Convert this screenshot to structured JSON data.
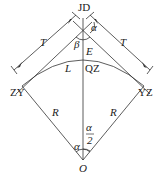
{
  "diagram": {
    "type": "circular-curve-elements",
    "stroke_color": "#333333",
    "background": "#ffffff",
    "labels": {
      "vertex": "JD",
      "deflection_angle": "α",
      "inner_angle": "β",
      "external_distance": "E",
      "curve_length": "L",
      "midpoint": "QZ",
      "start_point": "ZY",
      "end_point": "YZ",
      "tangent_left": "T",
      "tangent_right": "T",
      "radius_left": "R",
      "radius_right": "R",
      "center": "O",
      "center_angle": "α",
      "half_angle_num": "α",
      "half_angle_den": "2"
    }
  }
}
